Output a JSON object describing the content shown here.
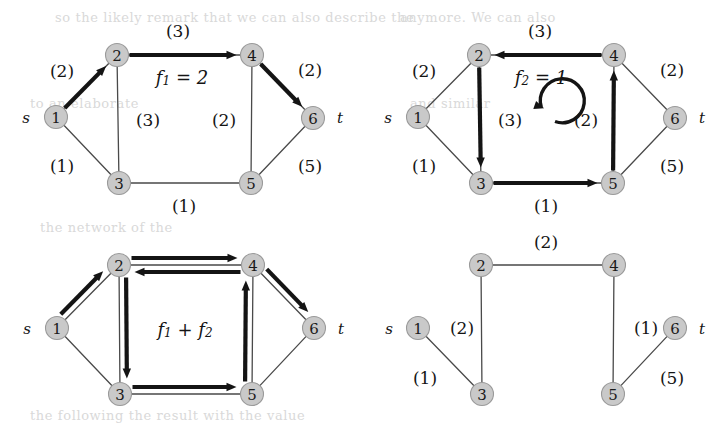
{
  "figure": {
    "width": 723,
    "height": 427,
    "background": "#ffffff",
    "node_fill": "#c9c9c9",
    "node_stroke": "#9a9a9a",
    "thin_edge_color": "#4a4a4a",
    "bold_edge_color": "#141414",
    "source_label": "s",
    "sink_label": "t"
  },
  "panels": [
    {
      "id": "top-left",
      "name": "flow-f1-panel",
      "flow_label": "f",
      "flow_sub": "1",
      "flow_eq": " = 2",
      "flow_label_full": "f1 = 2",
      "nodes": [
        {
          "id": "1",
          "label": "1",
          "x": 56,
          "y": 117
        },
        {
          "id": "2",
          "label": "2",
          "x": 117,
          "y": 55
        },
        {
          "id": "3",
          "label": "3",
          "x": 119,
          "y": 183
        },
        {
          "id": "4",
          "label": "4",
          "x": 252,
          "y": 55
        },
        {
          "id": "5",
          "label": "5",
          "x": 251,
          "y": 183
        },
        {
          "id": "6",
          "label": "6",
          "x": 313,
          "y": 118
        }
      ],
      "terminals": [
        {
          "name": "source-marker",
          "label": "s",
          "x": 26,
          "y": 118
        },
        {
          "name": "sink-marker",
          "label": "t",
          "x": 340,
          "y": 118
        }
      ],
      "edges": [
        {
          "from": "1",
          "to": "2",
          "capacity": "(2)",
          "label_x": 62,
          "label_y": 71,
          "bold": true,
          "arrow": "to"
        },
        {
          "from": "2",
          "to": "3",
          "capacity": "(3)",
          "label_x": 148,
          "label_y": 120,
          "bold": false,
          "arrow": "none"
        },
        {
          "from": "1",
          "to": "3",
          "capacity": "(1)",
          "label_x": 62,
          "label_y": 166,
          "bold": false,
          "arrow": "none"
        },
        {
          "from": "2",
          "to": "4",
          "capacity": "(3)",
          "label_x": 178,
          "label_y": 31,
          "bold": true,
          "arrow": "to"
        },
        {
          "from": "3",
          "to": "5",
          "capacity": "(1)",
          "label_x": 184,
          "label_y": 206,
          "bold": false,
          "arrow": "none"
        },
        {
          "from": "4",
          "to": "5",
          "capacity": "(2)",
          "label_x": 224,
          "label_y": 120,
          "bold": false,
          "arrow": "none"
        },
        {
          "from": "4",
          "to": "6",
          "capacity": "(2)",
          "label_x": 310,
          "label_y": 70,
          "bold": true,
          "arrow": "to"
        },
        {
          "from": "5",
          "to": "6",
          "capacity": "(5)",
          "label_x": 310,
          "label_y": 166,
          "bold": false,
          "arrow": "none"
        }
      ],
      "flow_label_x": 182,
      "flow_label_y": 77
    },
    {
      "id": "top-right",
      "name": "flow-f2-panel",
      "flow_label": "f",
      "flow_sub": "2",
      "flow_eq": " = 1",
      "flow_label_full": "f2 = 1",
      "nodes": [
        {
          "id": "1",
          "label": "1",
          "x": 418,
          "y": 117
        },
        {
          "id": "2",
          "label": "2",
          "x": 479,
          "y": 55
        },
        {
          "id": "3",
          "label": "3",
          "x": 481,
          "y": 183
        },
        {
          "id": "4",
          "label": "4",
          "x": 614,
          "y": 55
        },
        {
          "id": "5",
          "label": "5",
          "x": 613,
          "y": 183
        },
        {
          "id": "6",
          "label": "6",
          "x": 675,
          "y": 118
        }
      ],
      "terminals": [
        {
          "name": "source-marker",
          "label": "s",
          "x": 388,
          "y": 118
        },
        {
          "name": "sink-marker",
          "label": "t",
          "x": 702,
          "y": 118
        }
      ],
      "edges": [
        {
          "from": "1",
          "to": "2",
          "capacity": "(2)",
          "label_x": 424,
          "label_y": 71,
          "bold": false,
          "arrow": "none"
        },
        {
          "from": "2",
          "to": "3",
          "capacity": "(3)",
          "label_x": 510,
          "label_y": 120,
          "bold": true,
          "arrow": "to"
        },
        {
          "from": "1",
          "to": "3",
          "capacity": "(1)",
          "label_x": 424,
          "label_y": 166,
          "bold": false,
          "arrow": "none"
        },
        {
          "from": "4",
          "to": "2",
          "capacity": "(3)",
          "label_x": 540,
          "label_y": 31,
          "bold": true,
          "arrow": "to"
        },
        {
          "from": "3",
          "to": "5",
          "capacity": "(1)",
          "label_x": 546,
          "label_y": 206,
          "bold": true,
          "arrow": "to"
        },
        {
          "from": "5",
          "to": "4",
          "capacity": "(2)",
          "label_x": 586,
          "label_y": 120,
          "bold": true,
          "arrow": "to"
        },
        {
          "from": "4",
          "to": "6",
          "capacity": "(2)",
          "label_x": 672,
          "label_y": 70,
          "bold": false,
          "arrow": "none"
        },
        {
          "from": "5",
          "to": "6",
          "capacity": "(5)",
          "label_x": 672,
          "label_y": 166,
          "bold": false,
          "arrow": "none"
        }
      ],
      "flow_label_x": 541,
      "flow_label_y": 77,
      "cycle_icon": {
        "name": "circular-arrow-icon",
        "cx": 534,
        "cy": 128,
        "r": 22
      }
    },
    {
      "id": "bottom-left",
      "name": "flow-sum-panel",
      "flow_label_full": "f1 + f2",
      "flow_label": "f",
      "flow_sub": "1",
      "flow_mid": " + ",
      "flow_label2": "f",
      "flow_sub2": "2",
      "nodes": [
        {
          "id": "1",
          "label": "1",
          "x": 57,
          "y": 328
        },
        {
          "id": "2",
          "label": "2",
          "x": 119,
          "y": 265
        },
        {
          "id": "3",
          "label": "3",
          "x": 120,
          "y": 394
        },
        {
          "id": "4",
          "label": "4",
          "x": 253,
          "y": 265
        },
        {
          "id": "5",
          "label": "5",
          "x": 252,
          "y": 394
        },
        {
          "id": "6",
          "label": "6",
          "x": 314,
          "y": 328
        }
      ],
      "terminals": [
        {
          "name": "source-marker",
          "label": "s",
          "x": 27,
          "y": 329
        },
        {
          "name": "sink-marker",
          "label": "t",
          "x": 341,
          "y": 329
        }
      ],
      "edges": [
        {
          "from": "1",
          "to": "2",
          "capacity": "",
          "bold": true,
          "arrow": "to"
        },
        {
          "from": "2",
          "to": "3",
          "capacity": "",
          "bold": true,
          "arrow": "to"
        },
        {
          "from": "1",
          "to": "3",
          "capacity": "",
          "bold": false,
          "arrow": "none"
        },
        {
          "from": "2",
          "to": "4",
          "capacity": "",
          "bold": true,
          "arrow": "to"
        },
        {
          "from": "4",
          "to": "2",
          "capacity": "",
          "bold": true,
          "arrow": "to"
        },
        {
          "from": "3",
          "to": "5",
          "capacity": "",
          "bold": true,
          "arrow": "to"
        },
        {
          "from": "5",
          "to": "4",
          "capacity": "",
          "bold": true,
          "arrow": "to"
        },
        {
          "from": "4",
          "to": "6",
          "capacity": "",
          "bold": true,
          "arrow": "to"
        },
        {
          "from": "5",
          "to": "6",
          "capacity": "",
          "bold": false,
          "arrow": "none"
        }
      ],
      "flow_label_x": 185,
      "flow_label_y": 329
    },
    {
      "id": "bottom-right",
      "name": "residual-panel",
      "nodes": [
        {
          "id": "1",
          "label": "1",
          "x": 418,
          "y": 328
        },
        {
          "id": "2",
          "label": "2",
          "x": 481,
          "y": 265
        },
        {
          "id": "3",
          "label": "3",
          "x": 482,
          "y": 394
        },
        {
          "id": "4",
          "label": "4",
          "x": 614,
          "y": 265
        },
        {
          "id": "5",
          "label": "5",
          "x": 613,
          "y": 394
        },
        {
          "id": "6",
          "label": "6",
          "x": 675,
          "y": 328
        }
      ],
      "terminals": [
        {
          "name": "source-marker",
          "label": "s",
          "x": 389,
          "y": 329
        },
        {
          "name": "sink-marker",
          "label": "t",
          "x": 702,
          "y": 329
        }
      ],
      "edges": [
        {
          "from": "2",
          "to": "4",
          "capacity": "(2)",
          "label_x": 546,
          "label_y": 242,
          "bold": false,
          "arrow": "none"
        },
        {
          "from": "2",
          "to": "3",
          "capacity": "(2)",
          "label_x": 462,
          "label_y": 328,
          "bold": false,
          "arrow": "none"
        },
        {
          "from": "1",
          "to": "3",
          "capacity": "(1)",
          "label_x": 425,
          "label_y": 378,
          "bold": false,
          "arrow": "none"
        },
        {
          "from": "4",
          "to": "5",
          "capacity": "(1)",
          "label_x": 646,
          "label_y": 328,
          "bold": false,
          "arrow": "none"
        },
        {
          "from": "5",
          "to": "6",
          "capacity": "(5)",
          "label_x": 672,
          "label_y": 378,
          "bold": false,
          "arrow": "none"
        }
      ]
    }
  ],
  "graph_data": {
    "type": "diagram",
    "description": "Network flow figure: four panels of the same 6-node s-t network",
    "node_ids": [
      "1",
      "2",
      "3",
      "4",
      "5",
      "6"
    ],
    "source": "1",
    "sink": "6",
    "capacities": {
      "1-2": 2,
      "1-3": 1,
      "2-3": 3,
      "2-4": 3,
      "3-5": 1,
      "4-5": 2,
      "4-6": 2,
      "5-6": 5
    },
    "flows": [
      {
        "name": "f1",
        "value": 2,
        "path": [
          "1",
          "2",
          "4",
          "6"
        ]
      },
      {
        "name": "f2",
        "value": 1,
        "cycle": [
          "2",
          "3",
          "5",
          "4",
          "2"
        ]
      }
    ],
    "residual_capacities": {
      "2-4": 2,
      "2-3": 2,
      "1-3": 1,
      "4-5": 1,
      "5-6": 5
    }
  },
  "ghost_text": [
    {
      "x": 55,
      "y": 22,
      "text": "so the likely remark that we can also describe the"
    },
    {
      "x": 400,
      "y": 22,
      "text": "anymore. We can also"
    },
    {
      "x": 30,
      "y": 108,
      "text": "to an elaborate"
    },
    {
      "x": 410,
      "y": 108,
      "text": "and similar"
    },
    {
      "x": 40,
      "y": 232,
      "text": "the network of the"
    },
    {
      "x": 30,
      "y": 420,
      "text": "the following the result with the value"
    }
  ]
}
